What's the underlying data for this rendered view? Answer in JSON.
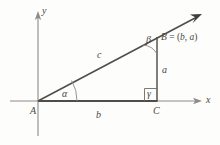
{
  "figure": {
    "type": "right-triangle-coordinate-diagram",
    "axes": {
      "x_label": "x",
      "y_label": "y"
    },
    "vertices": {
      "a_label": "A",
      "b_label": "B",
      "c_label": "C"
    },
    "sides": {
      "opposite_label": "a",
      "adjacent_label": "b",
      "hypotenuse_label": "c"
    },
    "angles": {
      "alpha_label": "α",
      "beta_label": "β",
      "gamma_label": "γ"
    },
    "annotations": {
      "point_b_coordinates": "B = (b, a)",
      "point_b_name": "B",
      "point_b_equals": " = (",
      "point_b_x": "b",
      "point_b_sep": ", ",
      "point_b_y": "a",
      "point_b_close": ")"
    },
    "colors": {
      "axis_stroke": "#8e8b87",
      "triangle_stroke": "#4f4c49",
      "ray_stroke": "#4f4c49",
      "label_text": "#4a4744",
      "background": "#fdfdfc"
    },
    "geometry": {
      "origin_x": 38,
      "origin_y": 101,
      "point_c_x": 157,
      "point_c_y": 101,
      "point_b_x": 157,
      "point_b_y": 37,
      "ray_tip_x": 201,
      "ray_tip_y": 14,
      "x_axis_start": 10,
      "x_axis_end": 199,
      "y_axis_top": 13,
      "y_axis_bottom": 136
    }
  }
}
